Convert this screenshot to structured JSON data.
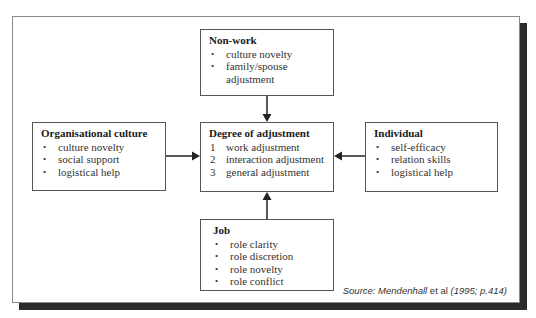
{
  "boxes": {
    "nonwork": {
      "title": "Non-work",
      "items": [
        "culture novelty",
        "family/spouse",
        "adjustment"
      ]
    },
    "organisational": {
      "title": "Organisational culture",
      "items": [
        "culture novelty",
        "social support",
        "logistical help"
      ]
    },
    "degree": {
      "title": "Degree of adjustment",
      "numbers": [
        "1",
        "2",
        "3"
      ],
      "items": [
        "work adjustment",
        "interaction adjustment",
        "general adjustment"
      ]
    },
    "individual": {
      "title": "Individual",
      "items": [
        "self-efficacy",
        "relation skills",
        "logistical help"
      ]
    },
    "job": {
      "title": "Job",
      "items": [
        "role clarity",
        "role discretion",
        "role novelty",
        "role conflict"
      ]
    }
  },
  "bullet": "•",
  "source": {
    "prefix": "Source: Mendenhall",
    "etal": " et al ",
    "cite": "(1995; p.414)"
  },
  "colors": {
    "shadow": "#2b2b2b",
    "border": "#555555",
    "text": "#333333"
  }
}
